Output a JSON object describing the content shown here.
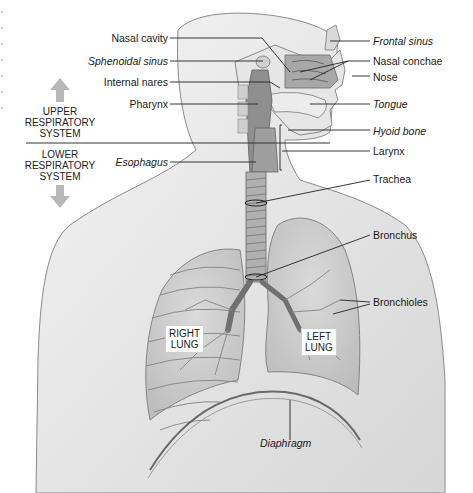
{
  "figure": {
    "type": "anatomical-diagram",
    "subject": "Respiratory system",
    "left_labels": [
      {
        "id": "nasal-cavity",
        "text": "Nasal cavity",
        "italic": false
      },
      {
        "id": "sphenoidal-sinus",
        "text": "Sphenoidal sinus",
        "italic": true
      },
      {
        "id": "internal-nares",
        "text": "Internal nares",
        "italic": false
      },
      {
        "id": "pharynx",
        "text": "Pharynx",
        "italic": false
      },
      {
        "id": "esophagus",
        "text": "Esophagus",
        "italic": true
      }
    ],
    "right_labels": [
      {
        "id": "frontal-sinus",
        "text": "Frontal sinus",
        "italic": true
      },
      {
        "id": "nasal-conchae",
        "text": "Nasal conchae",
        "italic": false
      },
      {
        "id": "nose",
        "text": "Nose",
        "italic": false
      },
      {
        "id": "tongue",
        "text": "Tongue",
        "italic": true
      },
      {
        "id": "hyoid-bone",
        "text": "Hyoid bone",
        "italic": true
      },
      {
        "id": "larynx",
        "text": "Larynx",
        "italic": false
      },
      {
        "id": "trachea",
        "text": "Trachea",
        "italic": false
      },
      {
        "id": "bronchus",
        "text": "Bronchus",
        "italic": false
      },
      {
        "id": "bronchioles",
        "text": "Bronchioles",
        "italic": false
      }
    ],
    "bottom_labels": [
      {
        "id": "diaphragm",
        "text": "Diaphragm",
        "italic": true
      }
    ],
    "lung_tags": {
      "right": {
        "line1": "RIGHT",
        "line2": "LUNG"
      },
      "left": {
        "line1": "LEFT",
        "line2": "LUNG"
      }
    },
    "system_divider": {
      "upper": {
        "line1": "UPPER",
        "line2": "RESPIRATORY",
        "line3": "SYSTEM"
      },
      "lower": {
        "line1": "LOWER",
        "line2": "RESPIRATORY",
        "line3": "SYSTEM"
      }
    },
    "colors": {
      "background": "#ffffff",
      "skin_shade": "#d9d9d9",
      "outline": "#7a7a7a",
      "airway": "#8c8c8c",
      "arrow": "#b8b8b8",
      "leader_line": "#222222"
    }
  }
}
